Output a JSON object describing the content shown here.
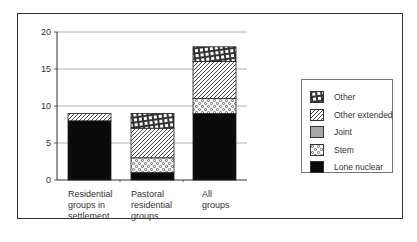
{
  "chart_data": {
    "type": "bar",
    "stacked": true,
    "title": "",
    "xlabel": "",
    "ylabel": "",
    "ylim": [
      0,
      20
    ],
    "yticks": [
      0,
      5,
      10,
      15,
      20
    ],
    "grid": true,
    "legend_position": "right",
    "categories": [
      "Residential groups in settlement",
      "Pastoral residential groups",
      "All groups"
    ],
    "series": [
      {
        "name": "Lone nuclear",
        "pattern": "solid-black",
        "values": [
          8,
          1,
          9
        ]
      },
      {
        "name": "Stem",
        "pattern": "circles",
        "values": [
          0,
          2,
          2
        ]
      },
      {
        "name": "Joint",
        "pattern": "solid-grey",
        "values": [
          0,
          0,
          0
        ]
      },
      {
        "name": "Other extended",
        "pattern": "diagonal-hatch",
        "values": [
          1,
          4,
          5
        ]
      },
      {
        "name": "Other",
        "pattern": "crosshatch",
        "values": [
          0,
          2,
          2
        ]
      }
    ]
  },
  "axis": {
    "y_ticks": [
      "0",
      "5",
      "10",
      "15",
      "20"
    ]
  },
  "categories": [
    {
      "lines": [
        "Residential",
        "groups in",
        "settlement"
      ]
    },
    {
      "lines": [
        "Pastoral",
        "residential",
        "groups"
      ]
    },
    {
      "lines": [
        "All",
        "groups"
      ]
    }
  ],
  "legend": [
    {
      "label": "Other",
      "pattern": "crosshatch"
    },
    {
      "label": "Other extended",
      "pattern": "diagonal-hatch"
    },
    {
      "label": "Joint",
      "pattern": "solid-grey"
    },
    {
      "label": "Stem",
      "pattern": "circles"
    },
    {
      "label": "Lone nuclear",
      "pattern": "solid-black"
    }
  ],
  "colors": {
    "lone_nuclear": "#0a0a0a",
    "joint": "#a8a8a8",
    "grid": "#999999",
    "frame": "#333333"
  }
}
